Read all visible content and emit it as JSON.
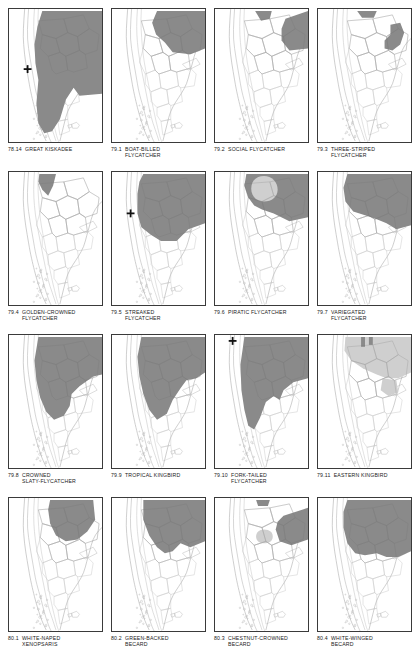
{
  "page": {
    "kind": "field-guide-range-map-plate",
    "region_outline": "southern-south-america",
    "columns": 4,
    "rows": 4,
    "colors": {
      "range_dark": "#8a8a8a",
      "range_light": "#cfcfcf",
      "coastline": "#b9b9b9",
      "border_line": "#c9c9c9",
      "frame": "#3a3a3a",
      "marker": "#111111",
      "paper": "#ffffff",
      "caption_text": "#1a1a1a"
    }
  },
  "maps": [
    {
      "number": "78.14",
      "name": "GREAT KISKADEE",
      "name_lines": "GREAT KISKADEE",
      "marker": true,
      "marker_x": 19,
      "marker_y": 61,
      "shapes": [
        {
          "tone": "dark",
          "d": "M34 2 L95 2 L95 86 L72 88 L66 80 L58 92 L52 112 L44 124 L36 126 L30 116 L28 96 L30 72 L27 55 L26 36 L29 18 Z"
        }
      ]
    },
    {
      "number": "79.1",
      "name": "BOAT-BILLED FLYCATCHER",
      "name_lines": "BOAT-BILLED\nFLYCATCHER",
      "marker": false,
      "shapes": [
        {
          "tone": "dark",
          "d": "M46 2 L95 2 L95 40 L80 46 L62 44 L54 34 L45 26 L41 14 Z"
        }
      ]
    },
    {
      "number": "79.2",
      "name": "SOCIAL FLYCATCHER",
      "name_lines": "SOCIAL FLYCATCHER",
      "marker": false,
      "shapes": [
        {
          "tone": "dark",
          "d": "M41 2 L58 2 L56 10 L47 12 Z"
        },
        {
          "tone": "dark",
          "d": "M72 10 L95 2 L95 40 L76 42 L68 32 L68 20 Z"
        }
      ]
    },
    {
      "number": "79.3",
      "name": "THREE-STRIPED FLYCATCHER",
      "name_lines": "THREE-STRIPED\nFLYCATCHER",
      "marker": false,
      "shapes": [
        {
          "tone": "dark",
          "d": "M40 2 L60 2 L57 9 L45 9 Z"
        },
        {
          "tone": "dark",
          "d": "M74 16 L84 14 L88 24 L84 36 L76 42 L68 40 L68 32 L74 26 Z"
        }
      ]
    },
    {
      "number": "79.4",
      "name": "GOLDEN-CROWNED FLYCATCHER",
      "name_lines": "GOLDEN-CROWNED\nFLYCATCHER",
      "marker": false,
      "shapes": [
        {
          "tone": "dark",
          "d": "M31 2 L48 2 L45 14 L40 24 L34 18 L30 10 Z"
        }
      ]
    },
    {
      "number": "79.5",
      "name": "STREAKED FLYCATCHER",
      "name_lines": "STREAKED\nFLYCATCHER",
      "marker": true,
      "marker_x": 19,
      "marker_y": 42,
      "shapes": [
        {
          "tone": "dark",
          "d": "M32 2 L95 2 L95 52 L78 58 L66 70 L50 70 L40 64 L30 56 L26 42 L26 22 L28 10 Z"
        }
      ]
    },
    {
      "number": "79.6",
      "name": "PIRATIC FLYCATCHER",
      "name_lines": "PIRATIC FLYCATCHER",
      "marker": false,
      "shapes": [
        {
          "tone": "dark",
          "d": "M32 2 L95 2 L95 46 L76 50 L60 42 L48 38 L40 34 L34 26 L30 14 Z"
        },
        {
          "tone": "hole",
          "d": "M50 4 C58 4 64 10 64 18 C64 25 58 30 50 30 C42 30 37 24 37 17 C37 9 42 4 50 4 Z"
        }
      ]
    },
    {
      "number": "79.7",
      "name": "VARIEGATED FLYCATCHER",
      "name_lines": "VARIEGATED\nFLYCATCHER",
      "marker": false,
      "shapes": [
        {
          "tone": "dark",
          "d": "M30 2 L95 2 L95 54 L80 58 L70 52 L60 48 L48 44 L36 40 L28 30 L26 16 Z"
        }
      ]
    },
    {
      "number": "79.8",
      "name": "CROWNED SLATY-FLYCATCHER",
      "name_lines": "CROWNED\nSLATY-FLYCATCHER",
      "marker": false,
      "shapes": [
        {
          "tone": "dark",
          "d": "M30 2 L95 2 L95 40 L86 42 L72 52 L64 60 L62 72 L56 82 L46 86 L38 78 L32 64 L28 46 L26 26 Z"
        }
      ]
    },
    {
      "number": "79.9",
      "name": "TROPICAL KINGBIRD",
      "name_lines": "TROPICAL KINGBIRD",
      "marker": false,
      "shapes": [
        {
          "tone": "dark",
          "d": "M30 2 L95 2 L95 38 L86 44 L76 46 L70 54 L62 66 L56 80 L46 86 L38 76 L32 60 L28 42 L26 22 Z"
        }
      ]
    },
    {
      "number": "79.10",
      "name": "FORK-TAILED FLYCATCHER",
      "name_lines": "FORK-TAILED\nFLYCATCHER",
      "marker": true,
      "marker_x": 18,
      "marker_y": 6,
      "shapes": [
        {
          "tone": "dark",
          "d": "M30 2 L95 2 L95 44 L80 48 L70 56 L66 66 L60 62 L52 68 L46 84 L40 96 L34 92 L30 76 L27 56 L26 30 Z"
        }
      ]
    },
    {
      "number": "79.11",
      "name": "EASTERN KINGBIRD",
      "name_lines": "EASTERN KINGBIRD",
      "marker": false,
      "shapes": [
        {
          "tone": "light",
          "d": "M28 2 L95 2 L95 38 L82 44 L70 44 L60 40 L46 34 L34 26 L27 16 Z"
        },
        {
          "tone": "light",
          "d": "M66 44 L80 46 L82 58 L72 62 L64 56 Z"
        },
        {
          "tone": "dark",
          "d": "M44 2 L48 2 L48 12 L44 12 Z"
        },
        {
          "tone": "dark",
          "d": "M52 2 L56 2 L56 10 L52 10 Z"
        }
      ]
    },
    {
      "number": "80.1",
      "name": "WHITE-NAPED XENOPSARIS",
      "name_lines": "WHITE-NAPED\nXENOPSARIS",
      "marker": false,
      "shapes": [
        {
          "tone": "dark",
          "d": "M42 2 L86 2 L88 22 L80 34 L70 42 L58 44 L48 38 L42 26 L40 12 Z"
        }
      ]
    },
    {
      "number": "80.2",
      "name": "GREEN-BACKED BECARD",
      "name_lines": "GREEN-BACKED\nBECARD",
      "marker": false,
      "shapes": [
        {
          "tone": "dark",
          "d": "M32 2 L95 2 L95 44 L80 50 L70 46 L62 54 L54 56 L46 50 L38 38 L32 22 Z"
        }
      ]
    },
    {
      "number": "80.3",
      "name": "CHESTNUT-CROWNED BECARD",
      "name_lines": "CHESTNUT-CROWNED\nBECARD",
      "marker": false,
      "shapes": [
        {
          "tone": "dark",
          "d": "M42 2 L56 2 L54 8 L44 8 Z"
        },
        {
          "tone": "dark",
          "d": "M70 18 L95 10 L95 42 L78 48 L66 44 L62 32 L64 24 Z"
        },
        {
          "tone": "light",
          "d": "M50 32 C56 32 59 35 59 39 C59 43 56 46 50 46 C45 46 42 43 42 39 C42 35 45 32 50 32 Z"
        }
      ]
    },
    {
      "number": "80.4",
      "name": "WHITE-WINGED BECARD",
      "name_lines": "WHITE-WINGED\nBECARD",
      "marker": false,
      "shapes": [
        {
          "tone": "dark",
          "d": "M30 2 L95 2 L95 54 L82 60 L70 60 L60 56 L48 58 L38 56 L30 46 L26 30 L26 14 Z"
        }
      ]
    }
  ]
}
